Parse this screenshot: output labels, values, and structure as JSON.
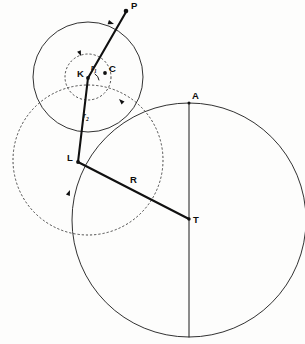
{
  "figure": {
    "background_color": "#fdfdfc",
    "stroke_color": "#1b1b1b",
    "width": 305,
    "height": 344
  },
  "labels": {
    "p": "P",
    "c": "C",
    "k": "K",
    "l": "L",
    "r": "R",
    "t": "T",
    "a": "A",
    "r_sub_1": "r",
    "r_sub_1_index": "1",
    "r_sub_2": "r",
    "r_sub_2_index": "2"
  },
  "points": [
    {
      "name": "P",
      "x": 126,
      "y": 11,
      "label_dx": 5,
      "label_dy": -10
    },
    {
      "name": "C",
      "x": 105,
      "y": 73,
      "label_dx": 4,
      "label_dy": -9
    },
    {
      "name": "K",
      "x": 88,
      "y": 78,
      "label_dx": -11,
      "label_dy": -9
    },
    {
      "name": "L",
      "x": 78,
      "y": 162,
      "label_dx": -11,
      "label_dy": -9
    },
    {
      "name": "T",
      "x": 189,
      "y": 219,
      "label_dx": 4,
      "label_dy": -4
    },
    {
      "name": "A",
      "x": 189,
      "y": 103,
      "label_dx": 3,
      "label_dy": -12
    }
  ],
  "circles": [
    {
      "name": "large-solid-circle",
      "cx": 189,
      "cy": 220,
      "r": 117,
      "style": "solid"
    },
    {
      "name": "upper-solid-circle",
      "cx": 88,
      "cy": 77,
      "r": 55,
      "style": "solid"
    },
    {
      "name": "small-dashed-circle",
      "cx": 88,
      "cy": 77,
      "r": 23,
      "style": "dashed"
    },
    {
      "name": "large-dashed-circle",
      "cx": 88,
      "cy": 160,
      "r": 75,
      "style": "dashed"
    }
  ],
  "segments": [
    {
      "name": "segment-K-P",
      "x1": 88,
      "y1": 78,
      "x2": 126,
      "y2": 12,
      "weight": "heavy"
    },
    {
      "name": "segment-K-L",
      "x1": 88,
      "y1": 78,
      "x2": 78,
      "y2": 162,
      "weight": "heavy"
    },
    {
      "name": "segment-L-T",
      "x1": 78,
      "y1": 162,
      "x2": 189,
      "y2": 219,
      "weight": "heavy"
    },
    {
      "name": "segment-A-T",
      "x1": 189,
      "y1": 103,
      "x2": 189,
      "y2": 337,
      "weight": "thin"
    }
  ],
  "direction_arrows": [
    {
      "name": "arrow-upper-circle-top",
      "x": 112,
      "y": 24,
      "angle": 200
    },
    {
      "name": "arrow-small-circle-top",
      "x": 80,
      "y": 56,
      "angle": 250
    },
    {
      "name": "arrow-dashed-circle-ne",
      "x": 120,
      "y": 100,
      "angle": 42
    },
    {
      "name": "arrow-dashed-circle-sw",
      "x": 70,
      "y": 192,
      "angle": 115
    }
  ],
  "inline_labels": [
    {
      "name": "radius-label-r1",
      "x": 92,
      "y": 65,
      "text": "r",
      "index": "1"
    },
    {
      "name": "radius-label-r2",
      "x": 84,
      "y": 112,
      "text": "r",
      "index": "2"
    },
    {
      "name": "radius-label-R",
      "x": 130,
      "y": 174,
      "text": "R"
    }
  ]
}
